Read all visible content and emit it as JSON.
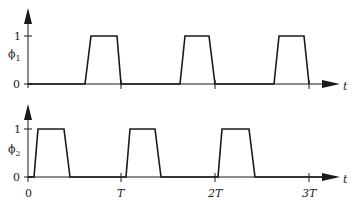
{
  "diagram": {
    "type": "timing-diagram",
    "signals": [
      {
        "name": "phi1",
        "label": "ϕ",
        "subscript": "1",
        "levels": [
          "0",
          "1"
        ],
        "pulses": [
          {
            "rise_start": 0.6,
            "rise_end": 0.67,
            "fall_start": 0.95,
            "fall_end": 1.0
          },
          {
            "rise_start": 1.6,
            "rise_end": 1.67,
            "fall_start": 1.95,
            "fall_end": 2.0
          },
          {
            "rise_start": 2.6,
            "rise_end": 2.67,
            "fall_start": 2.95,
            "fall_end": 3.0
          }
        ]
      },
      {
        "name": "phi2",
        "label": "ϕ",
        "subscript": "2",
        "levels": [
          "0",
          "1"
        ],
        "pulses": [
          {
            "rise_start": 0.05,
            "rise_end": 0.1,
            "fall_start": 0.38,
            "fall_end": 0.45
          },
          {
            "rise_start": 1.05,
            "rise_end": 1.1,
            "fall_start": 1.38,
            "fall_end": 1.45
          },
          {
            "rise_start": 2.05,
            "rise_end": 2.08,
            "fall_start": 2.38,
            "fall_end": 2.45
          }
        ]
      }
    ],
    "time_axis": {
      "label": "t",
      "ticks": [
        "0",
        "T",
        "2T",
        "3T"
      ]
    }
  },
  "labels": {
    "top_level_1": "1",
    "top_level_0": "0",
    "top_signal": "ϕ",
    "top_signal_sub": "1",
    "top_axis_t": "t",
    "bottom_level_1": "1",
    "bottom_level_0": "0",
    "bottom_signal": "ϕ",
    "bottom_signal_sub": "2",
    "bottom_axis_t": "t",
    "tick_0": "0",
    "tick_T": "T",
    "tick_2T": "2T",
    "tick_3T": "3T"
  },
  "colors": {
    "line": "#1a1a1a",
    "background": "#ffffff"
  }
}
